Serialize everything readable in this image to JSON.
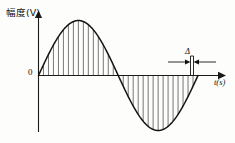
{
  "figure": {
    "title": "",
    "y_axis_label": "幅度(V)",
    "x_axis_label": "t(s)",
    "origin_label": "0",
    "delta_label": "Δ",
    "line_color": "#141414",
    "hatch_color": "#4a4a4a",
    "background_color": "#fdfdfc"
  },
  "chart_data": {
    "type": "line",
    "title": "",
    "subtitle": "",
    "xlabel": "t(s)",
    "ylabel": "幅度(V)",
    "xlim": [
      0,
      1
    ],
    "ylim": [
      -1,
      1
    ],
    "grid": false,
    "legend": "none",
    "annotations": [
      {
        "text": "Δ",
        "x": 0.88,
        "y": 0.35,
        "note": "sampling interval width marker with left and right arrows pointing at a narrow vertical strip"
      },
      {
        "text": "0",
        "x": 0.0,
        "y": 0.0,
        "note": "origin label at left of y-axis"
      }
    ],
    "series": [
      {
        "name": "sine waveform",
        "waveform": "sine",
        "periods": 1,
        "amplitude": 1,
        "phase": 0,
        "x": [
          0.0,
          0.05,
          0.1,
          0.15,
          0.2,
          0.25,
          0.3,
          0.35,
          0.4,
          0.45,
          0.5,
          0.55,
          0.6,
          0.65,
          0.7,
          0.75,
          0.8,
          0.85,
          0.9,
          0.95,
          1.0
        ],
        "values": [
          0.0,
          0.309,
          0.588,
          0.809,
          0.951,
          1.0,
          0.951,
          0.809,
          0.588,
          0.309,
          0.0,
          -0.309,
          -0.588,
          -0.809,
          -0.951,
          -1.0,
          -0.951,
          -0.809,
          -0.588,
          -0.309,
          0.0
        ]
      }
    ],
    "hatching": {
      "description": "vertical sampling lines drawn from the t-axis to the sine curve across the whole period",
      "count": 31,
      "orientation": "vertical"
    }
  }
}
